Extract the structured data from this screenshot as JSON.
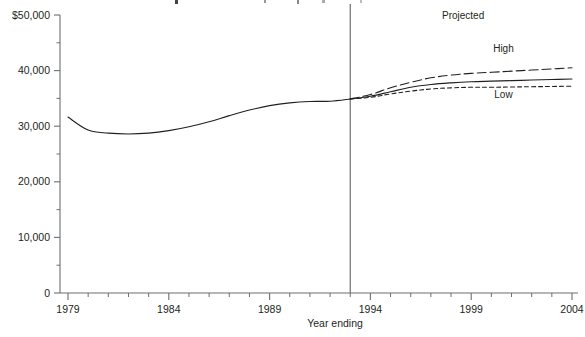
{
  "chart_data": {
    "type": "line",
    "title": "",
    "xlabel": "Year ending",
    "ylabel": "",
    "xlim": [
      1979,
      2004
    ],
    "ylim": [
      0,
      50000
    ],
    "grid": false,
    "legend": "inline-annotations",
    "x_ticks": [
      "1979",
      "1984",
      "1989",
      "1994",
      "1999",
      "2004"
    ],
    "x_tick_values": [
      1979,
      1984,
      1989,
      1994,
      1999,
      2004
    ],
    "x_minor_tick_step": 1,
    "y_ticks": [
      "0",
      "10,000",
      "20,000",
      "30,000",
      "40,000",
      "$50,000"
    ],
    "y_tick_values": [
      0,
      10000,
      20000,
      30000,
      40000,
      50000
    ],
    "y_minor_tick_values": [
      5000,
      15000,
      25000,
      35000,
      45000
    ],
    "projection_divider_year": 1993,
    "annotations": [
      {
        "text": "Projected",
        "x": 1998.6,
        "y": 49200
      },
      {
        "text": "High",
        "x": 2000.6,
        "y": 43300
      },
      {
        "text": "Low",
        "x": 2000.6,
        "y": 35100
      }
    ],
    "series": [
      {
        "name": "Actual",
        "style": "solid",
        "x": [
          1979,
          1980,
          1981,
          1982,
          1983,
          1984,
          1985,
          1986,
          1987,
          1988,
          1989,
          1990,
          1991,
          1992,
          1993
        ],
        "values": [
          31650,
          29300,
          28750,
          28600,
          28750,
          29200,
          29900,
          30800,
          31900,
          32900,
          33700,
          34200,
          34450,
          34500,
          34900
        ]
      },
      {
        "name": "High",
        "style": "dashed",
        "x": [
          1993,
          1994,
          1995,
          1996,
          1997,
          1998,
          1999,
          2000,
          2001,
          2002,
          2003,
          2004
        ],
        "values": [
          34900,
          35700,
          36900,
          37900,
          38700,
          39200,
          39500,
          39700,
          39900,
          40100,
          40300,
          40500
        ]
      },
      {
        "name": "Mid",
        "style": "solid",
        "x": [
          1993,
          1994,
          1995,
          1996,
          1997,
          1998,
          1999,
          2000,
          2001,
          2002,
          2003,
          2004
        ],
        "values": [
          34900,
          35400,
          36200,
          37000,
          37500,
          37800,
          38000,
          38100,
          38200,
          38300,
          38400,
          38500
        ]
      },
      {
        "name": "Low",
        "style": "dotted",
        "x": [
          1993,
          1994,
          1995,
          1996,
          1997,
          1998,
          1999,
          2000,
          2001,
          2002,
          2003,
          2004
        ],
        "values": [
          34900,
          35200,
          35800,
          36300,
          36700,
          36900,
          37000,
          37000,
          37050,
          37100,
          37150,
          37200
        ]
      }
    ]
  },
  "axes": {
    "y_axis_label_top": "$50,000",
    "x_axis_title": "Year ending"
  },
  "annotations": {
    "projected": "Projected",
    "high": "High",
    "low": "Low"
  },
  "colors": {
    "line": "#231f20",
    "axis": "#6d6e71",
    "background": "#ffffff"
  }
}
